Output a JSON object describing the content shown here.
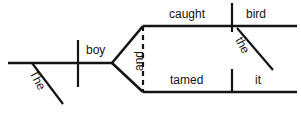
{
  "diagram": {
    "type": "reed-kellogg-sentence-diagram",
    "sentence": "The boy caught the bird and tamed it",
    "subject": {
      "word": "boy",
      "modifier": "The"
    },
    "conjunction": {
      "word": "and"
    },
    "branches": [
      {
        "position": "upper",
        "verb": "caught",
        "object": "bird",
        "object_modifier": "the"
      },
      {
        "position": "lower",
        "verb": "tamed",
        "object": "it",
        "object_modifier": ""
      }
    ],
    "ink_color": "#141414",
    "background_color": "#ffffff"
  }
}
